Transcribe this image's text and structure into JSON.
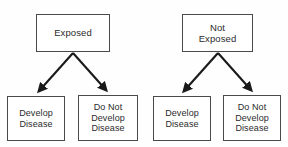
{
  "diagram": {
    "type": "flowchart",
    "colors": {
      "background": "#fefefe",
      "box_border": "#4a4a4a",
      "box_fill": "#ffffff",
      "text": "#2b2b2b",
      "arrow": "#1a1a1a"
    },
    "branches": [
      {
        "id": "exposed",
        "root": {
          "label": "Exposed"
        },
        "outcomes": [
          {
            "id": "exposed-develop",
            "label": "Develop\nDisease"
          },
          {
            "id": "exposed-nodevelop",
            "label": "Do Not\nDevelop\nDisease"
          }
        ]
      },
      {
        "id": "not-exposed",
        "root": {
          "label": "Not\nExposed"
        },
        "outcomes": [
          {
            "id": "not-exposed-develop",
            "label": "Develop\nDisease"
          },
          {
            "id": "not-exposed-nodevelop",
            "label": "Do Not\nDevelop\nDisease"
          }
        ]
      }
    ]
  }
}
